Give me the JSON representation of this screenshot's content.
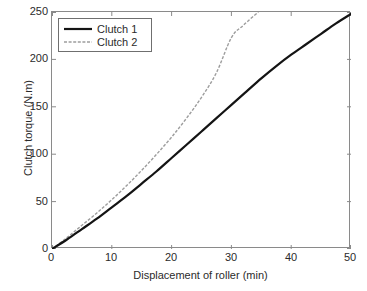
{
  "chart_data": {
    "type": "line",
    "title": "",
    "xlabel": "Displacement of roller (min)",
    "ylabel": "Clutch torque (N.m)",
    "xlim": [
      0,
      50
    ],
    "ylim": [
      0,
      250
    ],
    "xticks": [
      0,
      10,
      20,
      30,
      40,
      50
    ],
    "yticks": [
      0,
      50,
      100,
      150,
      200,
      250
    ],
    "xtick_labels": [
      "0",
      "10",
      "20",
      "30",
      "40",
      "50"
    ],
    "ytick_labels": [
      "0",
      "50",
      "100",
      "150",
      "200",
      "250"
    ],
    "grid": false,
    "legend_position": "upper left",
    "colors": {
      "clutch1": "#141414",
      "clutch2": "#9d9d9d",
      "axis": "#8a8a8a",
      "text": "#2b2b2b",
      "background": "#ffffff"
    },
    "series": [
      {
        "name": "Clutch 1",
        "style": "solid",
        "color": "#141414",
        "width": 2.2,
        "x": [
          0,
          2.5,
          5,
          7.5,
          10,
          12.5,
          15,
          17.5,
          20,
          22.5,
          25,
          27.5,
          30,
          32.5,
          35,
          37.5,
          40,
          42.5,
          45,
          47.5,
          50
        ],
        "y": [
          0,
          10,
          21,
          32,
          44,
          56,
          69,
          82,
          96,
          110,
          124,
          138,
          152,
          166,
          180,
          193,
          205,
          216,
          227,
          238,
          248
        ]
      },
      {
        "name": "Clutch 2",
        "style": "dashed",
        "color": "#9d9d9d",
        "width": 1.4,
        "x": [
          0,
          2.5,
          5,
          7.5,
          10,
          12.5,
          15,
          17.5,
          20,
          22.5,
          25,
          27.5,
          30,
          32,
          34.5
        ],
        "y": [
          0,
          12,
          25,
          38,
          52,
          67,
          83,
          100,
          118,
          138,
          160,
          186,
          223,
          236,
          250
        ],
        "note": "curve exits top of axes at approximately x = 34.5"
      }
    ],
    "annotations": [
      {
        "text": "Clutch 2 kink near x = 30, y = 223"
      }
    ]
  },
  "legend": {
    "items": [
      {
        "label": "Clutch 1"
      },
      {
        "label": "Clutch 2"
      }
    ]
  }
}
